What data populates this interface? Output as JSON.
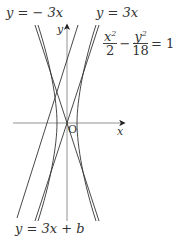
{
  "figure": {
    "hyperbola": {
      "equation_num1": "x",
      "exp1": "2",
      "den1": "2",
      "minus": "−",
      "equation_num2": "y",
      "exp2": "2",
      "den2": "18",
      "rhs": "= 1",
      "a_squared": 2,
      "b_squared": 18
    },
    "asymptote_neg": {
      "label": "y = − 3x",
      "slope": -3
    },
    "asymptote_pos": {
      "label": "y = 3x",
      "slope": 3
    },
    "line": {
      "label": "y = 3x + b",
      "slope": 3
    },
    "axes": {
      "x_label": "x",
      "y_label": "y",
      "origin_label": "O"
    },
    "colors": {
      "stroke": "#333333",
      "axis": "#555555",
      "background": "#ffffff"
    }
  }
}
